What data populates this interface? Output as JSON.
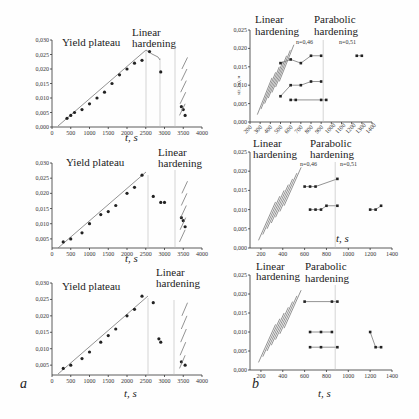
{
  "panels": {
    "a_label": "a",
    "b_label": "b"
  },
  "chart_data": [
    {
      "id": "a1",
      "type": "scatter",
      "annotations": [
        "Yield plateau",
        "Linear hardening"
      ],
      "xlabel": "t, s",
      "ylabel": "s(ε_m), м",
      "xticks": [
        "0",
        "500",
        "1000",
        "1500",
        "2000",
        "2500",
        "3000",
        "3500",
        "4000"
      ],
      "yticks": [
        "0,000",
        "0,005",
        "0,010",
        "0,015",
        "0,020",
        "0,025",
        "0,030"
      ],
      "xlim": [
        0,
        4000
      ],
      "ylim": [
        0,
        0.03
      ],
      "series": [
        {
          "name": "yield plateau points",
          "x": [
            400,
            500,
            600,
            800,
            1000,
            1200,
            1400,
            1600,
            1800,
            2000,
            2200,
            2400,
            2600
          ],
          "y": [
            0.003,
            0.004,
            0.005,
            0.006,
            0.008,
            0.01,
            0.012,
            0.015,
            0.018,
            0.02,
            0.022,
            0.023,
            0.026
          ]
        },
        {
          "name": "post-peak",
          "x": [
            2900,
            3450,
            3500,
            3550
          ],
          "y": [
            0.019,
            0.007,
            0.006,
            0.004
          ]
        }
      ]
    },
    {
      "id": "a2",
      "type": "scatter",
      "annotations": [
        "Yield plateau",
        "Linear hardening"
      ],
      "xlabel": "t, s",
      "ylabel": "s(ε_m), м",
      "xticks": [
        "0",
        "500",
        "1000",
        "1500",
        "2000",
        "2500",
        "3000",
        "3500",
        "4000"
      ],
      "yticks": [
        "0,005",
        "0,010",
        "0,015",
        "0,020",
        "0,025",
        "0,030"
      ],
      "xlim": [
        0,
        4000
      ],
      "ylim": [
        0.002,
        0.03
      ],
      "series": [
        {
          "name": "yield plateau points",
          "x": [
            300,
            500,
            800,
            1000,
            1300,
            1500,
            1700,
            2000,
            2200,
            2400
          ],
          "y": [
            0.004,
            0.005,
            0.007,
            0.01,
            0.013,
            0.014,
            0.016,
            0.02,
            0.022,
            0.026
          ]
        },
        {
          "name": "post-peak",
          "x": [
            2700,
            2900,
            3000,
            3450,
            3500,
            3550
          ],
          "y": [
            0.019,
            0.017,
            0.017,
            0.012,
            0.011,
            0.009
          ]
        }
      ]
    },
    {
      "id": "a3",
      "type": "scatter",
      "annotations": [
        "Yield plateau",
        "Linear hardening"
      ],
      "xlabel": "t, s",
      "ylabel": "s(ε_m), м",
      "xticks": [
        "0",
        "500",
        "1000",
        "1500",
        "2000",
        "2500",
        "3000",
        "3500",
        "4000"
      ],
      "yticks": [
        "0,005",
        "0,010",
        "0,015",
        "0,020",
        "0,025",
        "0,030"
      ],
      "xlim": [
        0,
        4000
      ],
      "ylim": [
        0.002,
        0.03
      ],
      "series": [
        {
          "name": "yield plateau points",
          "x": [
            300,
            500,
            800,
            1000,
            1300,
            1500,
            1700,
            2000,
            2200,
            2400
          ],
          "y": [
            0.004,
            0.005,
            0.007,
            0.009,
            0.012,
            0.014,
            0.016,
            0.02,
            0.022,
            0.026
          ]
        },
        {
          "name": "post-peak",
          "x": [
            2700,
            2850,
            2900,
            3450,
            3550
          ],
          "y": [
            0.024,
            0.013,
            0.012,
            0.006,
            0.005
          ]
        }
      ]
    },
    {
      "id": "b1",
      "type": "line",
      "annotations": [
        "Linear hardening",
        "Parabolic hardening",
        "n=0,46",
        "n=0,51"
      ],
      "xlabel": "t, c",
      "ylabel": "s(ε_m), м",
      "xticks": [
        "200",
        "300",
        "400",
        "500",
        "600",
        "700",
        "800",
        "900",
        "1000",
        "1100",
        "1200",
        "1300",
        "1400"
      ],
      "yticks": [
        "0,000",
        "0,005",
        "0,010",
        "0,015",
        "0,020",
        "0,025"
      ],
      "xlim": [
        200,
        1400
      ],
      "ylim": [
        0,
        0.025
      ],
      "series": [
        {
          "name": "level 1",
          "x": [
            500,
            600,
            700,
            800,
            900
          ],
          "y": [
            0.016,
            0.017,
            0.016,
            0.018,
            0.018
          ]
        },
        {
          "name": "level 2",
          "x": [
            500,
            600,
            700,
            800,
            900
          ],
          "y": [
            0.007,
            0.01,
            0.01,
            0.011,
            0.011
          ]
        },
        {
          "name": "level 3",
          "x": [
            600,
            650,
            900,
            950
          ],
          "y": [
            0.006,
            0.006,
            0.006,
            0.006
          ]
        },
        {
          "name": "late",
          "x": [
            1250,
            1300
          ],
          "y": [
            0.018,
            0.018
          ]
        }
      ]
    },
    {
      "id": "b2",
      "type": "line",
      "annotations": [
        "Linear hardening",
        "Parabolic hardening",
        "n=0,46",
        "n=0,51"
      ],
      "xlabel": "t, s",
      "ylabel": "s(ε_m), м",
      "xticks": [
        "200",
        "400",
        "600",
        "800",
        "1000",
        "1200",
        "1400"
      ],
      "yticks": [
        "0,000",
        "0,005",
        "0,010",
        "0,015",
        "0,020",
        "0,025"
      ],
      "xlim": [
        100,
        1400
      ],
      "ylim": [
        0,
        0.025
      ],
      "series": [
        {
          "name": "level 1",
          "x": [
            600,
            650,
            700,
            900
          ],
          "y": [
            0.016,
            0.016,
            0.016,
            0.018
          ]
        },
        {
          "name": "level 2",
          "x": [
            650,
            700,
            750,
            800,
            900
          ],
          "y": [
            0.01,
            0.01,
            0.01,
            0.011,
            0.011
          ]
        },
        {
          "name": "late",
          "x": [
            1200,
            1250,
            1300
          ],
          "y": [
            0.01,
            0.01,
            0.011
          ]
        }
      ]
    },
    {
      "id": "b3",
      "type": "line",
      "annotations": [
        "Linear hardening",
        "Parabolic hardening"
      ],
      "xlabel": "t, s",
      "ylabel": "s(ε_m), м",
      "xticks": [
        "200",
        "400",
        "600",
        "800",
        "1000",
        "1200",
        "1400"
      ],
      "yticks": [
        "0,000",
        "0,005",
        "0,010",
        "0,015",
        "0,020",
        "0,025"
      ],
      "xlim": [
        100,
        1400
      ],
      "ylim": [
        0,
        0.025
      ],
      "series": [
        {
          "name": "level 1",
          "x": [
            600,
            850,
            900
          ],
          "y": [
            0.018,
            0.018,
            0.018
          ]
        },
        {
          "name": "level 2",
          "x": [
            650,
            750,
            850
          ],
          "y": [
            0.01,
            0.01,
            0.01
          ]
        },
        {
          "name": "level 3",
          "x": [
            650,
            750,
            900
          ],
          "y": [
            0.006,
            0.006,
            0.006
          ]
        },
        {
          "name": "late",
          "x": [
            1200,
            1250,
            1300
          ],
          "y": [
            0.01,
            0.006,
            0.006
          ]
        }
      ]
    }
  ]
}
